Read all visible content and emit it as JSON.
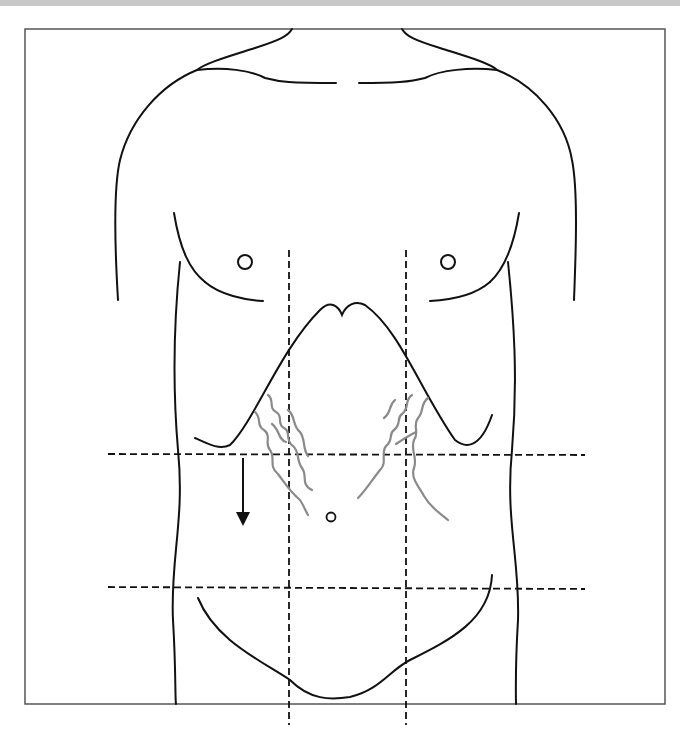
{
  "diagram": {
    "type": "anatomical-abdominal-regions",
    "regions_grid": {
      "vertical_lines": 2,
      "horizontal_lines": 2,
      "style": "dashed"
    },
    "markings": {
      "veins": "dilated tortuous superficial veins flanking upper abdomen",
      "umbilicus": "small circle",
      "arrow": "downward arrow indicating direction of flow",
      "nipples": 2
    },
    "colors": {
      "outline": "#111111",
      "veins": "#8a8a8a",
      "frame": "#555555",
      "top_bar": "#c8c8c8"
    }
  }
}
